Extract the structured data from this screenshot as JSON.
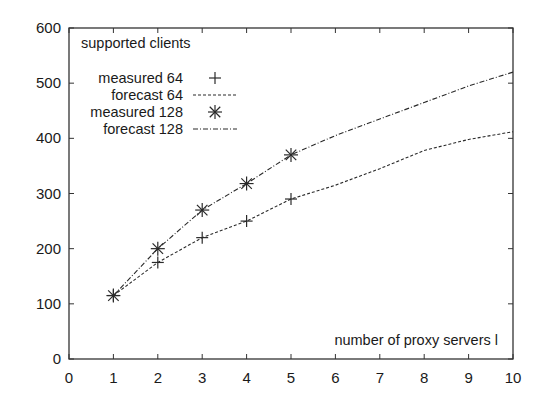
{
  "chart_data": {
    "type": "line",
    "title": "supported clients",
    "xlabel": "number of proxy servers l",
    "ylabel": "",
    "xlim": [
      0,
      10
    ],
    "ylim": [
      0,
      600
    ],
    "xticks": [
      0,
      1,
      2,
      3,
      4,
      5,
      6,
      7,
      8,
      9,
      10
    ],
    "yticks": [
      0,
      100,
      200,
      300,
      400,
      500,
      600
    ],
    "grid": false,
    "legend_position": "upper-left",
    "series": [
      {
        "name": "measured 64",
        "style": "markers",
        "marker": "+",
        "x": [
          1,
          2,
          3,
          4,
          5
        ],
        "values": [
          115,
          175,
          220,
          250,
          290
        ]
      },
      {
        "name": "forecast 64",
        "style": "dotted-line",
        "x": [
          1,
          2,
          3,
          4,
          5,
          6,
          7,
          8,
          9,
          10
        ],
        "values": [
          115,
          175,
          220,
          250,
          290,
          315,
          345,
          378,
          398,
          412
        ]
      },
      {
        "name": "measured 128",
        "style": "markers",
        "marker": "*",
        "x": [
          1,
          2,
          3,
          4,
          5
        ],
        "values": [
          115,
          200,
          270,
          318,
          370
        ]
      },
      {
        "name": "forecast 128",
        "style": "dash-dot-line",
        "x": [
          1,
          2,
          3,
          4,
          5,
          6,
          7,
          8,
          9,
          10
        ],
        "values": [
          115,
          200,
          270,
          318,
          370,
          405,
          435,
          465,
          495,
          520
        ]
      }
    ]
  },
  "colors": {
    "line": "#2a2a2a",
    "axis": "#333333",
    "background": "#ffffff"
  }
}
